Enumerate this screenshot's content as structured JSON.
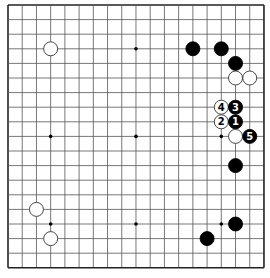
{
  "board": {
    "size": 19,
    "origin_x": 8,
    "origin_y": 5,
    "spacing_x": 14.22,
    "spacing_y": 14.6,
    "stone_radius": 7,
    "colors": {
      "background": "#ffffff",
      "line": "#555555",
      "border": "#222222",
      "black_stone": "#000000",
      "white_stone": "#ffffff",
      "white_stone_stroke": "#333333",
      "label_on_black": "#ffffff",
      "label_on_white": "#000000"
    },
    "star_points": [
      [
        3,
        3
      ],
      [
        9,
        3
      ],
      [
        15,
        3
      ],
      [
        3,
        9
      ],
      [
        9,
        9
      ],
      [
        15,
        9
      ],
      [
        3,
        15
      ],
      [
        9,
        15
      ],
      [
        15,
        15
      ]
    ],
    "stones": [
      {
        "col": 3,
        "row": 3,
        "color": "white",
        "label": ""
      },
      {
        "col": 13,
        "row": 3,
        "color": "black",
        "label": ""
      },
      {
        "col": 15,
        "row": 3,
        "color": "black",
        "label": ""
      },
      {
        "col": 16,
        "row": 4,
        "color": "black",
        "label": ""
      },
      {
        "col": 16,
        "row": 5,
        "color": "white",
        "label": ""
      },
      {
        "col": 17,
        "row": 5,
        "color": "white",
        "label": ""
      },
      {
        "col": 15,
        "row": 7,
        "color": "white",
        "label": "4"
      },
      {
        "col": 16,
        "row": 7,
        "color": "black",
        "label": "3"
      },
      {
        "col": 15,
        "row": 8,
        "color": "white",
        "label": "2"
      },
      {
        "col": 16,
        "row": 8,
        "color": "black",
        "label": "1"
      },
      {
        "col": 16,
        "row": 9,
        "color": "white",
        "label": ""
      },
      {
        "col": 17,
        "row": 9,
        "color": "black",
        "label": "5"
      },
      {
        "col": 16,
        "row": 11,
        "color": "black",
        "label": ""
      },
      {
        "col": 2,
        "row": 14,
        "color": "white",
        "label": ""
      },
      {
        "col": 16,
        "row": 15,
        "color": "black",
        "label": ""
      },
      {
        "col": 3,
        "row": 16,
        "color": "white",
        "label": ""
      },
      {
        "col": 14,
        "row": 16,
        "color": "black",
        "label": ""
      }
    ]
  }
}
